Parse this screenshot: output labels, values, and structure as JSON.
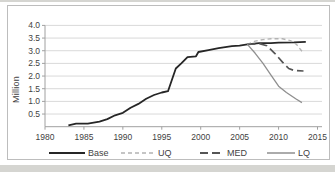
{
  "page": {
    "background": "#ffffff",
    "surround_color": "#d5d5d1",
    "panel_border": "#bdbdbd"
  },
  "chart_data": {
    "type": "line",
    "title": "",
    "xlabel": "",
    "ylabel": "Million",
    "xlim": [
      1980,
      2015
    ],
    "ylim": [
      0,
      4.0
    ],
    "grid": true,
    "legend_position": "bottom",
    "x_tick_labels": [
      "1980",
      "1985",
      "1990",
      "1995",
      "2000",
      "2005",
      "2010",
      "2015"
    ],
    "y_tick_labels": [
      "4.0",
      "3.5",
      "3.0",
      "2.5",
      "2.0",
      "1.5",
      "1.0",
      "0.5"
    ],
    "colors": {
      "grid": "#d9d9d9",
      "axis": "#a0a0a0",
      "text": "#3f3f3f"
    },
    "series": [
      {
        "name": "Base",
        "color": "#262626",
        "dash": null,
        "width": 1.8,
        "points": [
          [
            1983,
            0.05
          ],
          [
            1984,
            0.12
          ],
          [
            1985.5,
            0.12
          ],
          [
            1987,
            0.2
          ],
          [
            1988,
            0.3
          ],
          [
            1989,
            0.45
          ],
          [
            1990,
            0.55
          ],
          [
            1991,
            0.75
          ],
          [
            1992,
            0.9
          ],
          [
            1993,
            1.1
          ],
          [
            1994,
            1.25
          ],
          [
            1995,
            1.35
          ],
          [
            1995.8,
            1.4
          ],
          [
            1996.8,
            2.3
          ],
          [
            1997.5,
            2.5
          ],
          [
            1998.3,
            2.75
          ],
          [
            1999.4,
            2.78
          ],
          [
            1999.7,
            2.95
          ],
          [
            2001,
            3.02
          ],
          [
            2002.3,
            3.1
          ],
          [
            2004,
            3.18
          ],
          [
            2005,
            3.2
          ],
          [
            2006,
            3.25
          ],
          [
            2007.5,
            3.3
          ],
          [
            2009,
            3.3
          ],
          [
            2010,
            3.32
          ],
          [
            2012,
            3.33
          ],
          [
            2013.5,
            3.35
          ]
        ]
      },
      {
        "name": "UQ",
        "color": "#b3b3b3",
        "dash": "4 3",
        "width": 1.4,
        "points": [
          [
            2006,
            3.25
          ],
          [
            2007,
            3.38
          ],
          [
            2008,
            3.44
          ],
          [
            2009,
            3.47
          ],
          [
            2010.5,
            3.47
          ],
          [
            2011.5,
            3.4
          ],
          [
            2012.3,
            3.25
          ],
          [
            2013.2,
            2.9
          ]
        ]
      },
      {
        "name": "MED",
        "color": "#555555",
        "dash": "8 4",
        "width": 1.7,
        "points": [
          [
            2006,
            3.25
          ],
          [
            2007.5,
            3.28
          ],
          [
            2008.5,
            3.2
          ],
          [
            2009.5,
            2.9
          ],
          [
            2010.5,
            2.55
          ],
          [
            2011.3,
            2.3
          ],
          [
            2012,
            2.22
          ],
          [
            2013.2,
            2.2
          ]
        ]
      },
      {
        "name": "LQ",
        "color": "#8f8f8f",
        "dash": null,
        "width": 1.3,
        "points": [
          [
            2006,
            3.25
          ],
          [
            2007,
            2.9
          ],
          [
            2008,
            2.5
          ],
          [
            2009,
            2.05
          ],
          [
            2010,
            1.6
          ],
          [
            2011,
            1.35
          ],
          [
            2012.2,
            1.1
          ],
          [
            2013,
            0.95
          ]
        ]
      }
    ]
  }
}
